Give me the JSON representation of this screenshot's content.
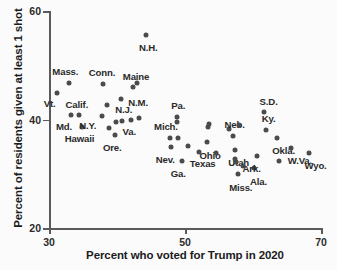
{
  "chart_data": {
    "type": "scatter",
    "title": "",
    "xlabel": "Percent who voted for Trump in 2020",
    "ylabel": "Percent of residents given at least 1 shot",
    "xlim": [
      30,
      70
    ],
    "ylim": [
      20,
      60
    ],
    "xticks": [
      30,
      50,
      70
    ],
    "yticks": [
      20,
      40,
      60
    ],
    "grid": false,
    "legend": null,
    "marker_color": "#4b4b4b",
    "axis_color": "#5a5a5a",
    "points": [
      {
        "label": "Vt.",
        "x": 31.2,
        "y": 44.9,
        "label_dx": -1.1,
        "label_dy": -1.9
      },
      {
        "label": "Mass.",
        "x": 33.0,
        "y": 46.8,
        "label_dx": -0.6,
        "label_dy": 2.2
      },
      {
        "label": "Md.",
        "x": 33.3,
        "y": 40.9,
        "label_dx": -1.1,
        "label_dy": -2.1
      },
      {
        "label": "Calif.",
        "x": 34.4,
        "y": 40.8,
        "label_dx": -0.3,
        "label_dy": 2.1
      },
      {
        "label": "Hawaii",
        "x": 34.8,
        "y": 38.6,
        "label_dx": -0.3,
        "label_dy": -2.1
      },
      {
        "label": "N.Y.",
        "x": 37.8,
        "y": 40.6,
        "label_dx": -2.1,
        "label_dy": -1.6
      },
      {
        "label": "Conn.",
        "x": 38.0,
        "y": 46.6,
        "label_dx": -0.2,
        "label_dy": 2.2
      },
      {
        "label": "N.J.",
        "x": 38.6,
        "y": 42.6,
        "label_dx": 2.4,
        "label_dy": -0.7
      },
      {
        "label": "",
        "x": 38.8,
        "y": 38.4,
        "label_dx": 0,
        "label_dy": 0
      },
      {
        "label": "Ore.",
        "x": 39.7,
        "y": 37.2,
        "label_dx": -0.4,
        "label_dy": -2.2
      },
      {
        "label": "",
        "x": 39.8,
        "y": 39.6,
        "label_dx": 0,
        "label_dy": 0
      },
      {
        "label": "N.M.",
        "x": 40.6,
        "y": 43.8,
        "label_dx": 2.5,
        "label_dy": -0.5
      },
      {
        "label": "",
        "x": 40.7,
        "y": 39.7,
        "label_dx": 0,
        "label_dy": 0
      },
      {
        "label": "Va.",
        "x": 42.0,
        "y": 40.0,
        "label_dx": -0.2,
        "label_dy": -2.2
      },
      {
        "label": "Maine",
        "x": 42.4,
        "y": 45.9,
        "label_dx": 0.4,
        "label_dy": 2.2
      },
      {
        "label": "",
        "x": 43.0,
        "y": 46.8,
        "label_dx": 0,
        "label_dy": 0
      },
      {
        "label": "",
        "x": 43.2,
        "y": 40.2,
        "label_dx": 0,
        "label_dy": 0
      },
      {
        "label": "N.H.",
        "x": 44.3,
        "y": 55.6,
        "label_dx": 0.3,
        "label_dy": -2.3
      },
      {
        "label": "Mich.",
        "x": 47.8,
        "y": 36.6,
        "label_dx": -0.6,
        "label_dy": 2.2
      },
      {
        "label": "Nev.",
        "x": 47.9,
        "y": 34.9,
        "label_dx": -0.8,
        "label_dy": -2.2
      },
      {
        "label": "Pa.",
        "x": 48.8,
        "y": 40.4,
        "label_dx": 0.2,
        "label_dy": 2.3
      },
      {
        "label": "",
        "x": 48.8,
        "y": 39.6,
        "label_dx": 0,
        "label_dy": 0
      },
      {
        "label": "",
        "x": 49.0,
        "y": 36.5,
        "label_dx": 0,
        "label_dy": 0
      },
      {
        "label": "Ga.",
        "x": 49.5,
        "y": 32.4,
        "label_dx": -0.5,
        "label_dy": -2.2
      },
      {
        "label": "",
        "x": 50.4,
        "y": 35.1,
        "label_dx": 0,
        "label_dy": 0
      },
      {
        "label": "Texas",
        "x": 52.1,
        "y": 34.1,
        "label_dx": 0.5,
        "label_dy": -2.2
      },
      {
        "label": "Ohio",
        "x": 53.3,
        "y": 35.8,
        "label_dx": 0.4,
        "label_dy": -2.3
      },
      {
        "label": "",
        "x": 53.4,
        "y": 38.7,
        "label_dx": 0,
        "label_dy": 0
      },
      {
        "label": "",
        "x": 53.5,
        "y": 39.2,
        "label_dx": 0,
        "label_dy": 0
      },
      {
        "label": "",
        "x": 54.6,
        "y": 33.8,
        "label_dx": 0,
        "label_dy": 0
      },
      {
        "label": "",
        "x": 56.4,
        "y": 38.3,
        "label_dx": 0,
        "label_dy": 0
      },
      {
        "label": "Neb.",
        "x": 57.0,
        "y": 36.9,
        "label_dx": 0.3,
        "label_dy": 2.3
      },
      {
        "label": "Utah",
        "x": 57.3,
        "y": 34.4,
        "label_dx": 0.6,
        "label_dy": -2.2
      },
      {
        "label": "",
        "x": 57.4,
        "y": 32.8,
        "label_dx": 0,
        "label_dy": 0
      },
      {
        "label": "",
        "x": 57.5,
        "y": 32.2,
        "label_dx": 0,
        "label_dy": 0
      },
      {
        "label": "Miss.",
        "x": 57.8,
        "y": 29.9,
        "label_dx": 0.4,
        "label_dy": -2.3
      },
      {
        "label": "",
        "x": 58.0,
        "y": 39.0,
        "label_dx": 0,
        "label_dy": 0
      },
      {
        "label": "",
        "x": 58.5,
        "y": 31.4,
        "label_dx": 0,
        "label_dy": 0
      },
      {
        "label": "Ala.",
        "x": 60.2,
        "y": 31.0,
        "label_dx": 0.6,
        "label_dy": -2.3
      },
      {
        "label": "Ark.",
        "x": 60.6,
        "y": 33.2,
        "label_dx": -0.8,
        "label_dy": -2.2
      },
      {
        "label": "S.D.",
        "x": 61.6,
        "y": 41.3,
        "label_dx": 0.7,
        "label_dy": 2.1
      },
      {
        "label": "Ky.",
        "x": 61.9,
        "y": 38.1,
        "label_dx": 0.4,
        "label_dy": 2.2
      },
      {
        "label": "Okla.",
        "x": 63.5,
        "y": 36.6,
        "label_dx": 1.0,
        "label_dy": -2.2
      },
      {
        "label": "",
        "x": 63.8,
        "y": 32.4,
        "label_dx": 0,
        "label_dy": 0
      },
      {
        "label": "W.Va.",
        "x": 65.6,
        "y": 34.8,
        "label_dx": 1.3,
        "label_dy": -2.2
      },
      {
        "label": "Wyo.",
        "x": 68.3,
        "y": 33.9,
        "label_dx": 0.9,
        "label_dy": -2.2
      }
    ]
  }
}
